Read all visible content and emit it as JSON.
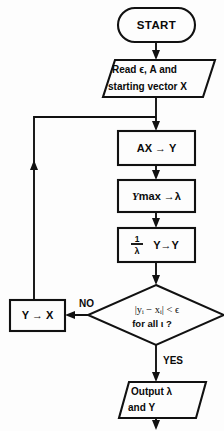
{
  "diagram": {
    "type": "flowchart",
    "background_color": "#fdfdfd",
    "line_color": "#111111",
    "nodes": [
      {
        "id": "start",
        "shape": "terminator",
        "label": "START"
      },
      {
        "id": "read",
        "shape": "parallelogram",
        "label_line1": "Read ϵ, A  and",
        "label_line2": "starting  vector X"
      },
      {
        "id": "multiply",
        "shape": "process",
        "label": "AX → Y"
      },
      {
        "id": "maximum",
        "shape": "process",
        "label_prefix": "Y",
        "label_suffix": "max →λ"
      },
      {
        "id": "normalize",
        "shape": "process",
        "numerator": "1",
        "denominator": "λ",
        "label_suffix": "Y→Y"
      },
      {
        "id": "converged",
        "shape": "decision",
        "label_line1": "|yᵢ − xᵢ| < ϵ",
        "label_line2": "for all ι ?"
      },
      {
        "id": "update",
        "shape": "process",
        "label": "Y → X"
      },
      {
        "id": "output",
        "shape": "parallelogram",
        "label_line1": "Output λ",
        "label_line2": "and Y"
      }
    ],
    "edge_labels": {
      "no": "NO",
      "yes": "YES"
    }
  }
}
